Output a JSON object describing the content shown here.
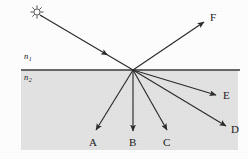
{
  "figure": {
    "canvas": {
      "width": 248,
      "height": 159,
      "background_color": "#fdfdfd"
    },
    "media": {
      "upper": {
        "label": "n",
        "subscript": "1",
        "label_x": 24,
        "label_y": 59,
        "fill_color": "#fdfdfd"
      },
      "lower": {
        "label": "n",
        "subscript": "2",
        "label_x": 24,
        "label_y": 80,
        "fill_color": "#e2e2e2"
      }
    },
    "interface": {
      "name": "interface-line",
      "x1": 21,
      "y1": 70,
      "x2": 240,
      "y2": 70,
      "color": "#3a3a3a",
      "stroke_width": 1.6
    },
    "shaded_region": {
      "x": 21,
      "y": 70,
      "width": 217,
      "height": 80,
      "fill_color": "#e2e2e2"
    },
    "incidence_point": {
      "x": 133,
      "y": 70
    },
    "source": {
      "name": "light-source-sun",
      "icon": "sun-icon",
      "x": 37,
      "y": 12,
      "radius": 3.1,
      "ray_count": 8,
      "color": "#555555"
    },
    "rays": [
      {
        "id": "incident",
        "name": "incident-ray",
        "label": "",
        "x1": 40,
        "y1": 15,
        "x2": 133,
        "y2": 70,
        "color": "#2b2b2b",
        "stroke_width": 1.15,
        "arrow": "midpoint",
        "arrow_x": 105,
        "arrow_y": 53.5,
        "label_x": 0,
        "label_y": 0
      },
      {
        "id": "F",
        "name": "reflected-ray-f",
        "label": "F",
        "x1": 133,
        "y1": 70,
        "x2": 204,
        "y2": 22,
        "color": "#2b2b2b",
        "stroke_width": 1.15,
        "arrow": "end",
        "label_x": 210,
        "label_y": 21
      },
      {
        "id": "E",
        "name": "refracted-ray-e",
        "label": "E",
        "x1": 133,
        "y1": 70,
        "x2": 216,
        "y2": 95,
        "color": "#2b2b2b",
        "stroke_width": 1.15,
        "arrow": "end",
        "label_x": 223,
        "label_y": 99
      },
      {
        "id": "D",
        "name": "refracted-ray-d",
        "label": "D",
        "x1": 133,
        "y1": 70,
        "x2": 226,
        "y2": 126,
        "color": "#2b2b2b",
        "stroke_width": 1.15,
        "arrow": "end",
        "label_x": 231,
        "label_y": 133
      },
      {
        "id": "C",
        "name": "refracted-ray-c",
        "label": "C",
        "x1": 133,
        "y1": 70,
        "x2": 167,
        "y2": 130,
        "color": "#2b2b2b",
        "stroke_width": 1.15,
        "arrow": "end",
        "label_x": 163,
        "label_y": 146
      },
      {
        "id": "B",
        "name": "refracted-ray-b",
        "label": "B",
        "x1": 133,
        "y1": 70,
        "x2": 133,
        "y2": 131,
        "color": "#2b2b2b",
        "stroke_width": 1.15,
        "arrow": "end",
        "label_x": 129,
        "label_y": 146
      },
      {
        "id": "A",
        "name": "refracted-ray-a",
        "label": "A",
        "x1": 133,
        "y1": 70,
        "x2": 96,
        "y2": 130,
        "color": "#2b2b2b",
        "stroke_width": 1.15,
        "arrow": "end",
        "label_x": 89,
        "label_y": 146
      }
    ]
  }
}
